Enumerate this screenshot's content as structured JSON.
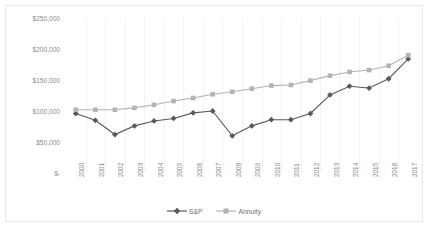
{
  "chart_data": {
    "type": "line",
    "title": "",
    "subtitle": "",
    "xlabel": "",
    "ylabel": "",
    "grid": "vertical",
    "legend_position": "bottom",
    "ylim": [
      0,
      250000
    ],
    "yticks": [
      0,
      50000,
      100000,
      150000,
      200000,
      250000
    ],
    "ytick_labels": [
      "$-",
      "$50,000",
      "$100,000",
      "$150,000",
      "$200,000",
      "$250,000"
    ],
    "categories": [
      "2000",
      "2001",
      "2002",
      "2003",
      "2004",
      "2005",
      "2006",
      "2007",
      "2008",
      "2009",
      "2010",
      "2011",
      "2012",
      "2013",
      "2014",
      "2015",
      "2016",
      "2017"
    ],
    "series": [
      {
        "name": "S&P",
        "marker": "diamond",
        "color": "#595959",
        "values": [
          96000,
          85000,
          62000,
          76000,
          84000,
          88000,
          97000,
          100000,
          60000,
          76000,
          86000,
          86000,
          96000,
          126000,
          140000,
          137000,
          152000,
          184000
        ]
      },
      {
        "name": "Annuity",
        "marker": "square",
        "color": "#b3b3b3",
        "values": [
          102000,
          102000,
          102000,
          105000,
          110000,
          116000,
          121000,
          127000,
          131000,
          136000,
          141000,
          142000,
          149000,
          157000,
          163000,
          166000,
          173000,
          190000
        ]
      }
    ]
  },
  "legend": {
    "items": [
      {
        "label": "S&P",
        "color": "#595959",
        "marker": "diamond"
      },
      {
        "label": "Annuity",
        "color": "#b3b3b3",
        "marker": "square"
      }
    ]
  },
  "colors": {
    "sp_line": "#595959",
    "annuity_line": "#b3b3b3",
    "gridline": "#f2f2f2",
    "axis_text": "#8c8c8c",
    "frame": "#e8e8e8"
  }
}
